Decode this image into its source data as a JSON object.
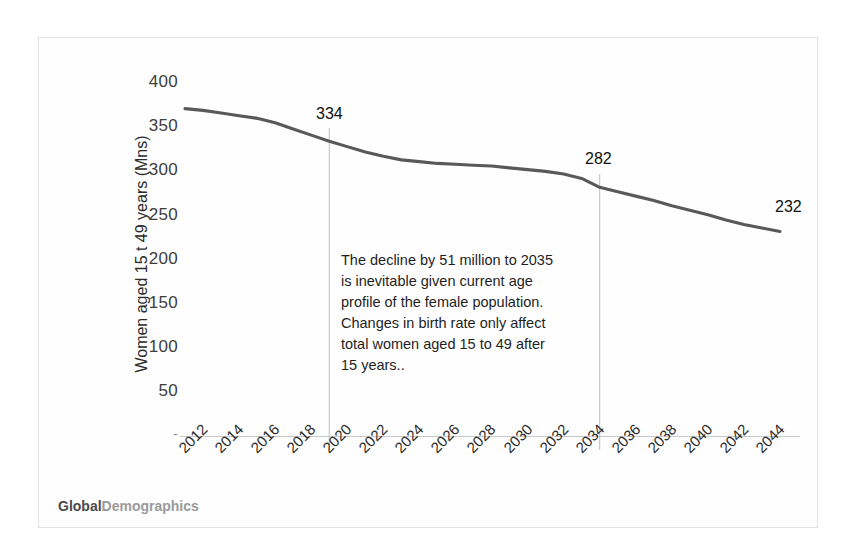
{
  "figure": {
    "background_color": "#ffffff",
    "border_color": "#e2e2e2",
    "line_color": "#595959",
    "gridline_color": "#bfbfbf",
    "axis_color": "#c9c9c9"
  },
  "brand": {
    "part1": "Global",
    "part2": "Demographics"
  },
  "annotation": {
    "line1": "The decline by 51 million to 2035",
    "line2": " is inevitable given current age",
    "line3": "profile of the female population.",
    "line4": "Changes in birth rate only affect",
    "line5": "total women aged 15 to 49 after",
    "line6": "15 years.."
  },
  "point_labels": {
    "p2020": "334",
    "p2035": "282",
    "p2045": "232"
  },
  "chart_data": {
    "type": "line",
    "title": "",
    "subtitle": "",
    "xlabel": "",
    "ylabel": "Women aged 15 t 49 years (Mns)",
    "ylim": [
      0,
      400
    ],
    "xlim": [
      2012,
      2045
    ],
    "grid": false,
    "legend": "none",
    "y_ticks": [
      "-",
      "50",
      "100",
      "150",
      "200",
      "250",
      "300",
      "350",
      "400"
    ],
    "y_tick_values": [
      0,
      50,
      100,
      150,
      200,
      250,
      300,
      350,
      400
    ],
    "x_tick_labels": [
      "2012",
      "2014",
      "2016",
      "2018",
      "2020",
      "2022",
      "2024",
      "2026",
      "2028",
      "2030",
      "2032",
      "2034",
      "2036",
      "2038",
      "2040",
      "2042",
      "2044"
    ],
    "x_tick_values": [
      2012,
      2014,
      2016,
      2018,
      2020,
      2022,
      2024,
      2026,
      2028,
      2030,
      2032,
      2034,
      2036,
      2038,
      2040,
      2042,
      2044
    ],
    "series": [
      {
        "name": "Women aged 15 to 49 years (Mns)",
        "x": [
          2012,
          2013,
          2014,
          2015,
          2016,
          2017,
          2018,
          2019,
          2020,
          2021,
          2022,
          2023,
          2024,
          2025,
          2026,
          2027,
          2028,
          2029,
          2030,
          2031,
          2032,
          2033,
          2034,
          2035,
          2036,
          2037,
          2038,
          2039,
          2040,
          2041,
          2042,
          2043,
          2044,
          2045
        ],
        "values": [
          371,
          369,
          366,
          363,
          360,
          355,
          348,
          341,
          334,
          328,
          322,
          317,
          313,
          311,
          309,
          308,
          307,
          306,
          304,
          302,
          300,
          297,
          292,
          282,
          277,
          272,
          267,
          261,
          256,
          251,
          245,
          240,
          236,
          232
        ]
      }
    ],
    "reference_lines": [
      {
        "name": "year-2020-marker",
        "x": 2020,
        "label": "334",
        "label_value": 334
      },
      {
        "name": "year-2035-marker",
        "x": 2035,
        "label": "282",
        "label_value": 282
      }
    ],
    "annotations": [
      {
        "name": "end-point-label",
        "x": 2045,
        "label": "232",
        "label_value": 232
      }
    ]
  }
}
